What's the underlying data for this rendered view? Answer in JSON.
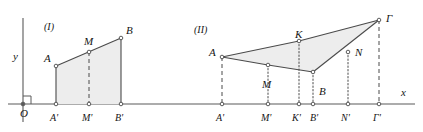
{
  "diagram": {
    "axes": {
      "x_label": "x",
      "y_label": "y",
      "origin_label": "O",
      "x_axis_y": 104,
      "y_axis_x": 23,
      "x_axis_start": 8,
      "x_axis_end": 415,
      "y_axis_top": 18,
      "y_axis_bottom": 122,
      "right_angle_marker": true
    },
    "colors": {
      "stroke": "#4a4a4a",
      "axis": "#5a5a5a",
      "fill": "#ededed",
      "label": "#151515",
      "marker_fill": "#ffffff"
    },
    "figures": [
      {
        "id": "figure-1",
        "caption": "(I)",
        "caption_pos": {
          "x": 44,
          "y": 22
        },
        "shape": "trapezoid",
        "polygon": [
          "A",
          "B",
          "B'",
          "A'"
        ],
        "points": [
          {
            "name": "A",
            "label": "A",
            "x": 56,
            "y": 66,
            "label_dx": -12,
            "label_dy": -13,
            "marker": true
          },
          {
            "name": "M",
            "label": "M",
            "x": 89,
            "y": 52,
            "label_dx": -5,
            "label_dy": -16,
            "marker": true
          },
          {
            "name": "B",
            "label": "B",
            "x": 121,
            "y": 38,
            "label_dx": 5,
            "label_dy": -13,
            "marker": true
          },
          {
            "name": "Ap",
            "label": "A'",
            "x": 56,
            "y": 104,
            "label_dx": -6,
            "label_dy": 9,
            "marker": true
          },
          {
            "name": "Mp",
            "label": "M'",
            "x": 89,
            "y": 104,
            "label_dx": -7,
            "label_dy": 9,
            "marker": true
          },
          {
            "name": "Bp",
            "label": "B'",
            "x": 121,
            "y": 104,
            "label_dx": -6,
            "label_dy": 9,
            "marker": true
          }
        ],
        "solid_edges": [
          [
            "A",
            "B"
          ],
          [
            "A",
            "Ap"
          ],
          [
            "B",
            "Bp"
          ]
        ],
        "dashed_drops": [
          [
            "M",
            "Mp"
          ]
        ]
      },
      {
        "id": "figure-2",
        "caption": "(II)",
        "caption_pos": {
          "x": 194,
          "y": 25
        },
        "shape": "quadrilateral",
        "polygon": [
          "A",
          "K",
          "Γ",
          "B"
        ],
        "points": [
          {
            "name": "A",
            "label": "A",
            "x": 222,
            "y": 57,
            "label_dx": -13,
            "label_dy": -10,
            "marker": true
          },
          {
            "name": "M",
            "label": "M",
            "x": 268,
            "y": 65,
            "label_dx": -6,
            "label_dy": 14,
            "marker": true
          },
          {
            "name": "K",
            "label": "K",
            "x": 299,
            "y": 41,
            "label_dx": -4,
            "label_dy": -12,
            "marker": true
          },
          {
            "name": "B",
            "label": "B",
            "x": 313,
            "y": 72,
            "label_dx": 6,
            "label_dy": 14,
            "marker": true
          },
          {
            "name": "N",
            "label": "N",
            "x": 348,
            "y": 52,
            "label_dx": 7,
            "label_dy": -5,
            "marker": true
          },
          {
            "name": "G",
            "label": "Γ",
            "x": 379,
            "y": 20,
            "label_dx": 7,
            "label_dy": -7,
            "marker": true
          },
          {
            "name": "Ap",
            "label": "A'",
            "x": 222,
            "y": 104,
            "label_dx": -6,
            "label_dy": 9,
            "marker": true
          },
          {
            "name": "Mp",
            "label": "M'",
            "x": 268,
            "y": 104,
            "label_dx": -7,
            "label_dy": 9,
            "marker": true
          },
          {
            "name": "Kp",
            "label": "K'",
            "x": 299,
            "y": 104,
            "label_dx": -7,
            "label_dy": 9,
            "marker": true
          },
          {
            "name": "Bp",
            "label": "B'",
            "x": 313,
            "y": 104,
            "label_dx": -3,
            "label_dy": 9,
            "marker": true
          },
          {
            "name": "Np",
            "label": "N'",
            "x": 348,
            "y": 104,
            "label_dx": -7,
            "label_dy": 9,
            "marker": true
          },
          {
            "name": "Gp",
            "label": "Γ'",
            "x": 379,
            "y": 104,
            "label_dx": -6,
            "label_dy": 9,
            "marker": true
          }
        ],
        "solid_edges": [
          [
            "A",
            "K"
          ],
          [
            "K",
            "G"
          ],
          [
            "G",
            "B"
          ],
          [
            "B",
            "M"
          ],
          [
            "M",
            "A"
          ]
        ],
        "dashed_drops": [
          [
            "A",
            "Ap"
          ],
          [
            "G",
            "Gp"
          ]
        ],
        "dotted_drops": [
          [
            "M",
            "Mp"
          ],
          [
            "K",
            "Kp"
          ],
          [
            "B",
            "Bp"
          ],
          [
            "N",
            "Np"
          ]
        ]
      }
    ]
  }
}
